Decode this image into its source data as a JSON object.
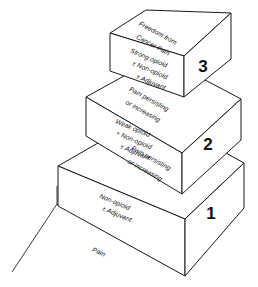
{
  "figure": {
    "name": "WHO three-step analgesic ladder",
    "line_color": "#1a1a1a",
    "face_color": "#ffffff",
    "background": "#ffffff"
  },
  "base": {
    "label": "Pain"
  },
  "steps": [
    {
      "number": "1",
      "top_face_lines": [
        "Pain persisting",
        "or increasing"
      ],
      "front_face_lines": [
        "Non-opioid",
        "± Adjuvant"
      ]
    },
    {
      "number": "2",
      "top_face_lines": [
        "Pain persisting",
        "or increasing"
      ],
      "front_face_lines": [
        "Weak opioid",
        "+ Non-opioid",
        "± Adjuvant"
      ]
    },
    {
      "number": "3",
      "top_face_lines": [
        "Freedom from",
        "Cancer Pain"
      ],
      "front_face_lines": [
        "Strong opioid",
        "± Non-opioid",
        "± Adjuvant"
      ]
    }
  ]
}
